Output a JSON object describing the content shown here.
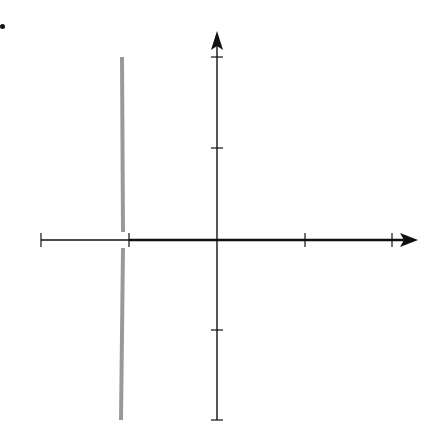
{
  "bullet": "•",
  "chart_data": {
    "type": "vector_field",
    "title": "",
    "xlabel": "x",
    "ylabel": "y",
    "xlim": [
      -2,
      2
    ],
    "ylim": [
      -2,
      2
    ],
    "x_ticks": [
      -2,
      -1,
      1,
      2
    ],
    "x_tick_labels": [
      "−2",
      "−1",
      "1",
      "2"
    ],
    "y_ticks": [
      -2,
      -1,
      1,
      2
    ],
    "y_tick_labels": [
      "−2",
      "−1",
      "1",
      "2"
    ],
    "grid": false,
    "arrow_color": "#9a9a9a",
    "axis_color": "#111111",
    "grid_x": [
      -2.0,
      -1.7,
      -1.37,
      -1.07,
      -0.74,
      -0.42,
      -0.11,
      0.2,
      0.52,
      0.83,
      1.15,
      1.45,
      1.76,
      1.99
    ],
    "grid_y": [
      1.95,
      1.66,
      1.36,
      1.05,
      0.76,
      0.47,
      0.19,
      -0.2,
      -0.47,
      -0.76,
      -1.06,
      -1.36,
      -1.66,
      -1.91
    ],
    "field_description": "Arrows point away from the vertical line x = -1 on its right (upward for y>0, downward for y<0) and toward the line on its left; near x = -1 arrows become long and vertical, forming a thick gray band. Far right arrows point right with slope decreasing toward the x-axis.",
    "special_features": {
      "thick_vertical_band_x": -1.07,
      "thick_x_axis_from": -1,
      "thick_x_axis_to": 2.2
    }
  },
  "axes": {
    "x_label": "x",
    "y_label": "y",
    "x_tick_labels": [
      "−2",
      "−1",
      "1",
      "2"
    ],
    "y_tick_labels": [
      "2",
      "1",
      "−1",
      "−2"
    ]
  }
}
